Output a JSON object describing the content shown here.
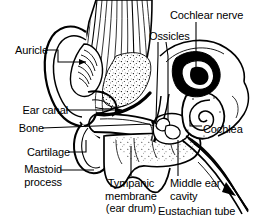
{
  "figure": {
    "type": "labeled anatomical line drawing",
    "background_color": "#ffffff",
    "ink_color": "#000000",
    "width": 260,
    "height": 221
  },
  "labels": {
    "auricle": {
      "text": "Auricle"
    },
    "ear_canal": {
      "text": "Ear canal"
    },
    "bone": {
      "text": "Bone"
    },
    "cartilage": {
      "text": "Cartilage"
    },
    "mastoid_process": {
      "line1": "Mastoid",
      "line2": "process"
    },
    "ossicles": {
      "text": "Ossicles"
    },
    "cochlear_nerve": {
      "text": "Cochlear nerve"
    },
    "cochlea": {
      "text": "Cochlea"
    },
    "tympanic_membrane": {
      "line1": "Tympanic",
      "line2": "membrane",
      "line3": "(ear drum)"
    },
    "middle_ear_cavity": {
      "line1": "Middle ear",
      "line2": "cavity"
    },
    "eustachian_tube": {
      "text": "Eustachian tube"
    }
  },
  "structures": {
    "auricle": "outer ear pinna",
    "temporal_bone": "striated bone mass",
    "ear_canal": "external auditory tube",
    "tympanic_membrane": "ear drum",
    "ossicles": "middle ear bones",
    "cochlea": "spiral organ",
    "cochlear_nerve": "auditory nerve",
    "eustachian_tube": "pharyngotympanic tube",
    "mastoid_process": "mastoid air cells",
    "cartilage": "canal cartilage"
  }
}
